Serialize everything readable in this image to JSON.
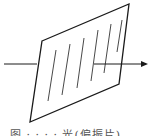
{
  "figure": {
    "stroke_color": "#1a1a1a",
    "hatch_color": "#333333",
    "plate": {
      "points": [
        [
          42,
          41
        ],
        [
          129,
          4
        ],
        [
          119,
          84
        ],
        [
          30,
          122
        ]
      ]
    },
    "ray": {
      "incoming": {
        "x1": 4,
        "y1": 64,
        "x2": 37,
        "y2": 64
      },
      "outgoing": {
        "x1": 94,
        "y1": 64,
        "x2": 146,
        "y2": 64
      },
      "arrowhead": [
        [
          148,
          64
        ],
        [
          141,
          61
        ],
        [
          141,
          67
        ]
      ]
    },
    "hatch_lines": [
      {
        "x1": 56,
        "y1": 50,
        "x2": 48,
        "y2": 101
      },
      {
        "x1": 70,
        "y1": 44,
        "x2": 62,
        "y2": 95
      },
      {
        "x1": 84,
        "y1": 38,
        "x2": 77,
        "y2": 88
      },
      {
        "x1": 98,
        "y1": 30,
        "x2": 91,
        "y2": 81
      },
      {
        "x1": 111,
        "y1": 24,
        "x2": 104,
        "y2": 73
      },
      {
        "x1": 122,
        "y1": 20,
        "x2": 117,
        "y2": 52
      }
    ]
  },
  "caption": {
    "text": "图 · · · · 光(偏振片)"
  }
}
